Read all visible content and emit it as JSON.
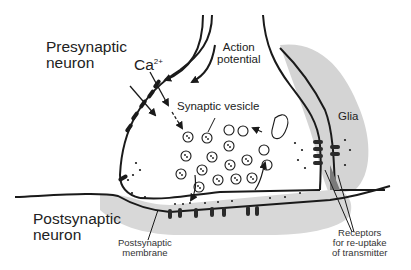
{
  "diagram": {
    "labels": {
      "presynaptic_neuron": [
        "Presynaptic",
        "neuron"
      ],
      "postsynaptic_neuron": [
        "Postsynaptic",
        "neuron"
      ],
      "calcium": "Ca",
      "calcium_charge": "2+",
      "action_potential": [
        "Action",
        "potential"
      ],
      "synaptic_vesicle": "Synaptic vesicle",
      "glia": "Glia",
      "postsynaptic_membrane": [
        "Postsynaptic",
        "membrane"
      ],
      "receptors": [
        "Receptors",
        "for re-uptake",
        "of transmitter"
      ]
    },
    "colors": {
      "line": "#1a1a1a",
      "glia_fill": "#d4d4d4",
      "postsynaptic_fill": "#d8d8d8",
      "dark_fill": "#7a7a7a"
    }
  }
}
